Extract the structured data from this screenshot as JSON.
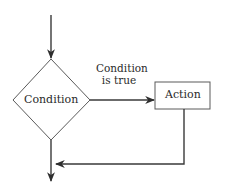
{
  "diagram": {
    "type": "flowchart",
    "title": "",
    "colors": {
      "background": "#ffffff",
      "stroke": "#3a3a3a",
      "text": "#2a2a2a"
    },
    "nodes": [
      {
        "id": "condition",
        "shape": "diamond",
        "label": "Condition"
      },
      {
        "id": "action",
        "shape": "rectangle",
        "label": "Action"
      }
    ],
    "edges": [
      {
        "from": "entry",
        "to": "condition",
        "label": ""
      },
      {
        "from": "condition",
        "to": "action",
        "label_line1": "Condition",
        "label_line2": "is true"
      },
      {
        "from": "action",
        "to": "merge",
        "label": ""
      },
      {
        "from": "condition",
        "to": "exit",
        "label": ""
      }
    ]
  }
}
